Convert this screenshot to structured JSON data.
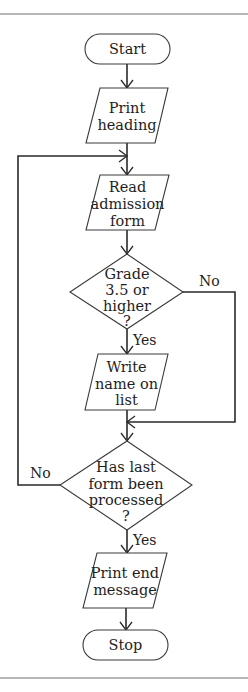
{
  "diagram": {
    "type": "flowchart",
    "nodes": [
      {
        "id": "start",
        "shape": "terminal",
        "lines": [
          "Start"
        ]
      },
      {
        "id": "print_heading",
        "shape": "io",
        "lines": [
          "Print",
          "heading"
        ]
      },
      {
        "id": "read_form",
        "shape": "io",
        "lines": [
          "Read",
          "admission",
          "form"
        ]
      },
      {
        "id": "grade_check",
        "shape": "decision",
        "lines": [
          "Grade",
          "3.5 or",
          "higher",
          "?"
        ]
      },
      {
        "id": "write_name",
        "shape": "io",
        "lines": [
          "Write",
          "name on",
          "list"
        ]
      },
      {
        "id": "last_form",
        "shape": "decision",
        "lines": [
          "Has last",
          "form been",
          "processed",
          "?"
        ]
      },
      {
        "id": "print_end",
        "shape": "io",
        "lines": [
          "Print end",
          "message"
        ]
      },
      {
        "id": "stop",
        "shape": "terminal",
        "lines": [
          "Stop"
        ]
      }
    ],
    "edges": [
      {
        "from": "start",
        "to": "print_heading",
        "label": ""
      },
      {
        "from": "print_heading",
        "to": "read_form",
        "label": ""
      },
      {
        "from": "read_form",
        "to": "grade_check",
        "label": ""
      },
      {
        "from": "grade_check",
        "to": "write_name",
        "label": "Yes"
      },
      {
        "from": "grade_check",
        "to": "last_form",
        "label": "No"
      },
      {
        "from": "write_name",
        "to": "last_form",
        "label": ""
      },
      {
        "from": "last_form",
        "to": "read_form",
        "label": "No"
      },
      {
        "from": "last_form",
        "to": "print_end",
        "label": "Yes"
      },
      {
        "from": "print_end",
        "to": "stop",
        "label": ""
      }
    ],
    "branch_labels": {
      "grade_yes": "Yes",
      "grade_no": "No",
      "last_yes": "Yes",
      "last_no": "No"
    }
  }
}
